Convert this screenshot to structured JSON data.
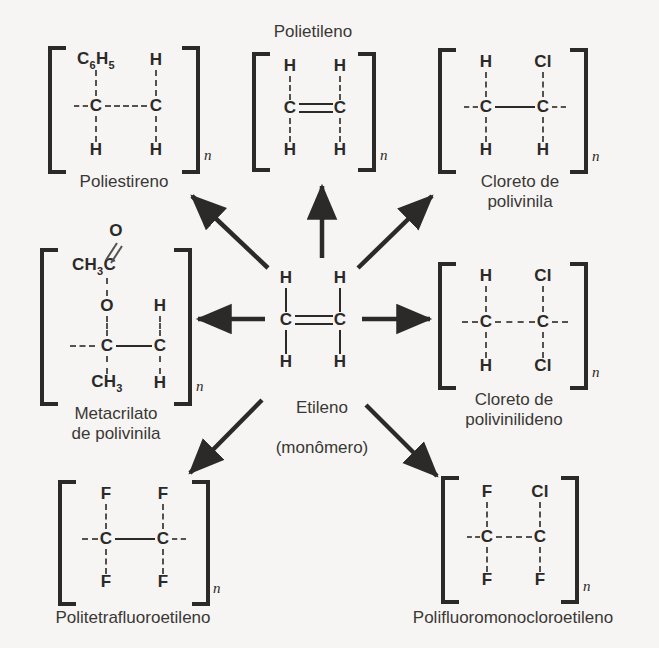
{
  "diagram": {
    "background_color": "#f6f5f3",
    "ink_color": "#2b2a28",
    "repeat_subscript": "n",
    "center": {
      "name": "Etileno",
      "caption_line1": "Etileno",
      "caption_line2": "(monômero)",
      "bond": "double",
      "atoms": {
        "left_top": "H",
        "right_top": "H",
        "left_carbon": "C",
        "right_carbon": "C",
        "left_bottom": "H",
        "right_bottom": "H"
      }
    },
    "polymers": [
      {
        "id": "poliestireno",
        "caption": "Poliestireno",
        "position": "top-left",
        "bond": "single",
        "atoms": {
          "left_top": "C6H5",
          "left_top_base": "C",
          "left_top_sub1": "6",
          "left_top_mid": "H",
          "left_top_sub2": "5",
          "right_top": "H",
          "left_carbon": "C",
          "right_carbon": "C",
          "left_bottom": "H",
          "right_bottom": "H"
        }
      },
      {
        "id": "polietileno",
        "caption": "Polietileno",
        "position": "top-center",
        "caption_placement": "above",
        "bond": "double",
        "atoms": {
          "left_top": "H",
          "right_top": "H",
          "left_carbon": "C",
          "right_carbon": "C",
          "left_bottom": "H",
          "right_bottom": "H"
        }
      },
      {
        "id": "cloreto-de-polivinila",
        "caption": "Cloreto de polivinila",
        "position": "top-right",
        "bond": "single",
        "atoms": {
          "left_top": "H",
          "right_top": "Cl",
          "left_carbon": "C",
          "right_carbon": "C",
          "left_bottom": "H",
          "right_bottom": "H"
        }
      },
      {
        "id": "metacrilato-de-polivinila",
        "caption": "Metacrilato\nde polivinila",
        "position": "middle-left",
        "bond": "single",
        "atoms": {
          "top_o": "O",
          "ch3c": "CH3C",
          "ester_o": "O",
          "right_top": "H",
          "left_carbon": "C",
          "right_carbon": "C",
          "left_bottom": "CH3",
          "right_bottom": "H"
        }
      },
      {
        "id": "cloreto-de-polivinilideno",
        "caption": "Cloreto de\npolivinilideno",
        "position": "middle-right",
        "bond": "single",
        "atoms": {
          "left_top": "H",
          "right_top": "Cl",
          "left_carbon": "C",
          "right_carbon": "C",
          "left_bottom": "H",
          "right_bottom": "Cl"
        }
      },
      {
        "id": "politetrafluoroetileno",
        "caption": "Politetrafluoroetileno",
        "position": "bottom-left",
        "bond": "single",
        "atoms": {
          "left_top": "F",
          "right_top": "F",
          "left_carbon": "C",
          "right_carbon": "C",
          "left_bottom": "F",
          "right_bottom": "F"
        }
      },
      {
        "id": "polifluoromonocloroetileno",
        "caption": "Polifluoromonocloroetileno",
        "position": "bottom-right",
        "bond": "single",
        "atoms": {
          "left_top": "F",
          "right_top": "Cl",
          "left_carbon": "C",
          "right_carbon": "C",
          "left_bottom": "F",
          "right_bottom": "F"
        }
      }
    ],
    "arrows": [
      {
        "id": "arrow-to-poliestireno",
        "direction": "up-left",
        "target": "poliestireno"
      },
      {
        "id": "arrow-to-polietileno",
        "direction": "up",
        "target": "polietileno"
      },
      {
        "id": "arrow-to-cloreto-de-polivinila",
        "direction": "up-right",
        "target": "cloreto-de-polivinila"
      },
      {
        "id": "arrow-to-metacrilato",
        "direction": "left",
        "target": "metacrilato-de-polivinila"
      },
      {
        "id": "arrow-to-cloreto-de-polivinilideno",
        "direction": "right",
        "target": "cloreto-de-polivinilideno"
      },
      {
        "id": "arrow-to-politetrafluoroetileno",
        "direction": "down-left",
        "target": "politetrafluoroetileno"
      },
      {
        "id": "arrow-to-polifluoromonocloroetileno",
        "direction": "down-right",
        "target": "polifluoromonocloroetileno"
      }
    ]
  }
}
